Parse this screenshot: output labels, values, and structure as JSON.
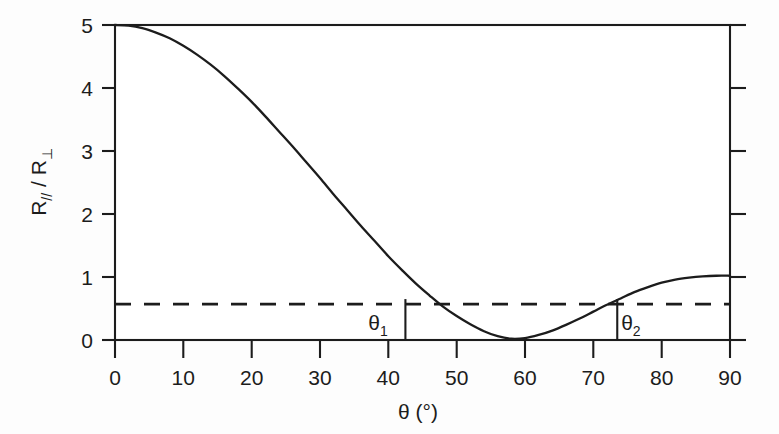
{
  "figure": {
    "background_color": "#fdfdfd",
    "ink_color": "#1c1c1c"
  },
  "chart_data": {
    "type": "line",
    "title": "",
    "subtitle": "",
    "xlabel": "θ (°)",
    "xlabel_symbol": "θ",
    "xlabel_unit": "(°)",
    "ylabel": "R// / R⊥",
    "ylabel_numerator": "R",
    "ylabel_numerator_sub": "//",
    "ylabel_separator": " / ",
    "ylabel_denominator": "R",
    "ylabel_denominator_sub": "⊥",
    "xlim": [
      0,
      90
    ],
    "ylim": [
      0,
      5
    ],
    "xticks": [
      0,
      10,
      20,
      30,
      40,
      50,
      60,
      70,
      80,
      90
    ],
    "xtick_labels": [
      "0",
      "10",
      "20",
      "30",
      "40",
      "50",
      "60",
      "70",
      "80",
      "90"
    ],
    "yticks": [
      0,
      1,
      2,
      3,
      4,
      5
    ],
    "ytick_labels": [
      "0",
      "1",
      "2",
      "3",
      "4",
      "5"
    ],
    "grid": false,
    "legend": false,
    "legend_position": "none",
    "series": [
      {
        "name": "R// / R⊥",
        "style": "solid",
        "x": [
          0,
          2,
          4,
          6,
          8,
          10,
          12,
          14,
          16,
          18,
          20,
          22,
          24,
          26,
          28,
          30,
          32,
          34,
          36,
          38,
          40,
          42,
          44,
          46,
          48,
          50,
          52,
          54,
          56,
          58,
          60,
          62,
          64,
          66,
          68,
          70,
          72,
          74,
          76,
          78,
          80,
          82,
          84,
          86,
          88,
          90
        ],
        "values": [
          5.0,
          4.99,
          4.95,
          4.88,
          4.79,
          4.67,
          4.53,
          4.37,
          4.19,
          3.99,
          3.78,
          3.55,
          3.31,
          3.07,
          2.82,
          2.57,
          2.31,
          2.06,
          1.81,
          1.57,
          1.33,
          1.11,
          0.9,
          0.71,
          0.53,
          0.38,
          0.25,
          0.14,
          0.06,
          0.02,
          0.03,
          0.08,
          0.15,
          0.24,
          0.34,
          0.45,
          0.56,
          0.66,
          0.76,
          0.84,
          0.91,
          0.96,
          0.99,
          1.01,
          1.02,
          1.02
        ]
      }
    ],
    "reference_line": {
      "name": "threshold",
      "orientation": "horizontal",
      "style": "dashed",
      "value": 0.57
    },
    "annotations": [
      {
        "name": "theta-1",
        "label": "θ",
        "subscript": "1",
        "x": 42.5,
        "label_x": 38.5,
        "description": "left crossing of curve with dashed reference line"
      },
      {
        "name": "theta-2",
        "label": "θ",
        "subscript": "2",
        "x": 73.5,
        "label_x": 75.5,
        "description": "right crossing of curve with dashed reference line"
      }
    ]
  }
}
